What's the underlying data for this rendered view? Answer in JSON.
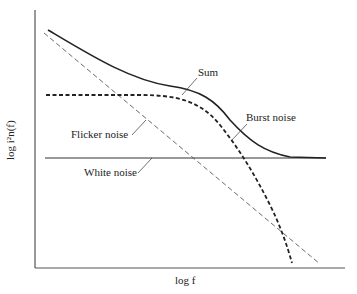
{
  "diagram": {
    "title": "",
    "axes": {
      "x_label": "log f",
      "y_label": "log i²n(f)"
    },
    "curves": [
      {
        "name": "Sum",
        "label": "Sum",
        "style": "solid-thick",
        "color": "#222222"
      },
      {
        "name": "Burst noise",
        "label": "Burst noise",
        "style": "dashed-thick",
        "color": "#222222"
      },
      {
        "name": "Flicker noise",
        "label": "Flicker noise",
        "style": "dashed-thin",
        "color": "#444444"
      },
      {
        "name": "White noise",
        "label": "White noise",
        "style": "solid-thin",
        "color": "#333333"
      }
    ]
  }
}
